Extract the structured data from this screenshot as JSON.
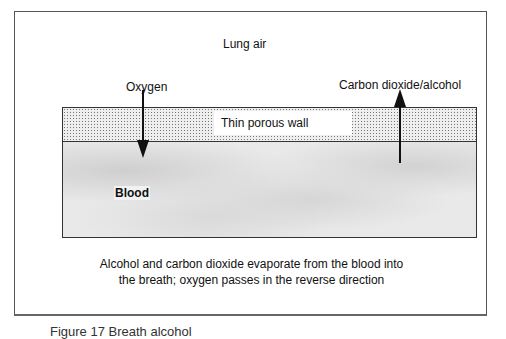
{
  "diagram": {
    "lung_air_label": "Lung air",
    "oxygen_label": "Oxygen",
    "co2_label": "Carbon dioxide/alcohol",
    "wall_label": "Thin porous wall",
    "blood_label": "Blood",
    "caption_line1": "Alcohol and carbon dioxide evaporate from the blood into",
    "caption_line2": "the breath; oxygen passes in the reverse direction",
    "figure_caption": "Figure 17 Breath alcohol"
  }
}
